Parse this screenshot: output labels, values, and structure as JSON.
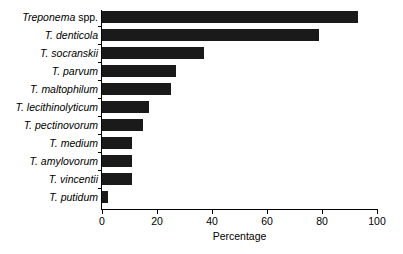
{
  "chart_data": {
    "type": "bar",
    "orientation": "horizontal",
    "title": "",
    "xlabel": "Percentage",
    "ylabel": "",
    "xlim": [
      0,
      100
    ],
    "xticks": [
      0,
      20,
      40,
      60,
      80,
      100
    ],
    "grid": false,
    "legend": false,
    "bar_color": "#1a1a1a",
    "axis_color": "#000000",
    "background_color": "#ffffff",
    "categories": [
      "Treponema spp.",
      "T. denticola",
      "T. socranskii",
      "T. parvum",
      "T. maltophilum",
      "T. lecithinolyticum",
      "T. pectinovorum",
      "T. medium",
      "T. amylovorum",
      "T. vincentii",
      "T. putidum"
    ],
    "category_parts": [
      {
        "italic": "Treponema",
        "roman": " spp."
      },
      {
        "italic": "T. denticola",
        "roman": ""
      },
      {
        "italic": "T. socranskii",
        "roman": ""
      },
      {
        "italic": "T. parvum",
        "roman": ""
      },
      {
        "italic": "T. maltophilum",
        "roman": ""
      },
      {
        "italic": "T. lecithinolyticum",
        "roman": ""
      },
      {
        "italic": "T. pectinovorum",
        "roman": ""
      },
      {
        "italic": "T. medium",
        "roman": ""
      },
      {
        "italic": "T. amylovorum",
        "roman": ""
      },
      {
        "italic": "T. vincentii",
        "roman": ""
      },
      {
        "italic": "T. putidum",
        "roman": ""
      }
    ],
    "values": [
      93,
      79,
      37,
      27,
      25,
      17,
      15,
      11,
      11,
      11,
      2
    ]
  }
}
